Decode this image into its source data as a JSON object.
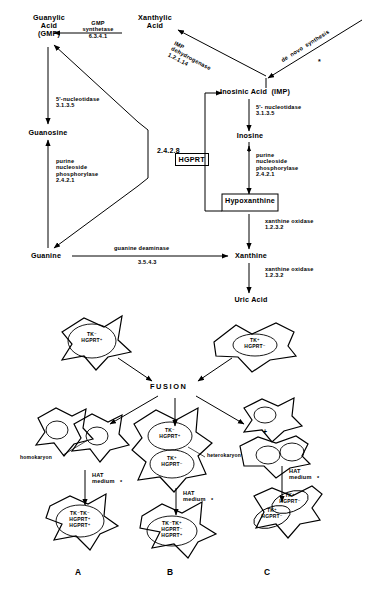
{
  "figure": {
    "title_absent": true,
    "panelA_caption": "A",
    "panelB_caption": "B",
    "panelC_caption": "C"
  },
  "pathway": {
    "nodes": {
      "guanylic_acid": "Guanylic\nAcid\n(GMP)",
      "xanthylic_acid": "Xanthylic\nAcid",
      "inosinic_acid": "Inosinic Acid  (IMP)",
      "guanosine": "Guanosine",
      "inosine": "Inosine",
      "hypoxanthine": "Hypoxanthine",
      "guanine": "Guanine",
      "xanthine": "Xanthine",
      "uric_acid": "Uric Acid"
    },
    "hgprt_box": {
      "name": "HGPRT",
      "ec": "2.4.2.8"
    },
    "enzymes": {
      "gmp_synthetase": "GMP\nsynthetase\n6.3.4.1",
      "imp_dehydrogenase": "IMP\ndehydrogenase\n1.2.1.14",
      "de_novo_synthesis": "de  novo  synthesis",
      "de_novo_asterisk": "*",
      "nucleotidase_left": "5'-nucleotidase\n3.1.3.5",
      "nucleotidase_right": "5'- nucleotidase\n3.1.3.5",
      "pnp_left": "purine\nnucleoside\nphosphorylase\n2.4.2.1",
      "pnp_right": "purine\nnucleoside\nphosphorylase\n2.4.2.1",
      "guanine_deaminase": "guanine deaminase",
      "guanine_deaminase_ec": "3.5.4.3",
      "xanthine_oxidase_1": "xanthine oxidase\n1.2.3.2",
      "xanthine_oxidase_2": "xanthine oxidase\n1.2.3.2"
    }
  },
  "fusion": {
    "heading": "FUSION",
    "parent_left": "TK⁻\nHGPRT⁺",
    "parent_right": "TK⁺\nHGPRT⁻",
    "homokaryon_label": "homokaryon",
    "heterokaryon_label": "heterokaryon",
    "plus_sign": "+",
    "hat_medium": "HAT\nmedium",
    "hat_asterisk": "*",
    "mid_cell_top": "TK⁻\nHGPRT⁺",
    "mid_cell_bottom": "TK⁺\nHGPRT⁻",
    "right_upper_nucleus": "TK⁺\nHGPRT⁻",
    "right_lower_nucleus": "TK⁺\nHGPRT⁻",
    "productA": "TK⁻TK⁻\nHGPRT⁺\nHGPRT⁺",
    "productB": "TK⁻TK⁺\nHGPRT⁻\nHGPRT⁺",
    "productC_nucleus1": "TK⁺\nHGPRT⁻",
    "productC_nucleus2": "TK⁺\nHGPRT⁻"
  },
  "colors": {
    "ink": "#000000",
    "paper": "#ffffff"
  }
}
